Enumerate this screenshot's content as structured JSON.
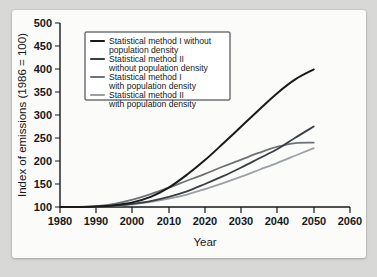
{
  "chart_data": {
    "type": "line",
    "title": "",
    "xlabel": "Year",
    "ylabel": "Index of emissions (1986 = 100)",
    "xlim": [
      1980,
      2060
    ],
    "ylim": [
      100,
      500
    ],
    "xticks": [
      1980,
      1990,
      2000,
      2010,
      2020,
      2030,
      2040,
      2050,
      2060
    ],
    "yticks": [
      100,
      150,
      200,
      250,
      300,
      350,
      400,
      450,
      500
    ],
    "grid": false,
    "legend_position": "upper-left",
    "x": [
      1980,
      1985,
      1990,
      1995,
      2000,
      2005,
      2010,
      2015,
      2020,
      2025,
      2030,
      2035,
      2040,
      2045,
      2050
    ],
    "series": [
      {
        "name": "Statistical method I without population density",
        "color": "#1a1a1a",
        "width": 2.0,
        "values": [
          100,
          100,
          101,
          104,
          110,
          122,
          142,
          170,
          202,
          238,
          275,
          312,
          348,
          378,
          399
        ]
      },
      {
        "name": "Statistical method II without population density",
        "color": "#3b3f44",
        "width": 1.8,
        "values": [
          100,
          100,
          101,
          103,
          107,
          113,
          122,
          134,
          150,
          167,
          186,
          206,
          226,
          251,
          275
        ]
      },
      {
        "name": "Statistical method I with population density",
        "color": "#6e7378",
        "width": 1.8,
        "values": [
          100,
          100,
          102,
          107,
          116,
          128,
          142,
          157,
          172,
          188,
          203,
          218,
          231,
          239,
          240
        ]
      },
      {
        "name": "Statistical method II with population density",
        "color": "#9aa0a5",
        "width": 1.8,
        "values": [
          100,
          100,
          101,
          103,
          106,
          111,
          118,
          127,
          139,
          152,
          166,
          181,
          196,
          212,
          228
        ]
      }
    ]
  },
  "legend": {
    "entries": [
      {
        "line1": "Statistical method I without",
        "line2": "population density"
      },
      {
        "line1": "Statistical method II",
        "line2": "without population density"
      },
      {
        "line1": "Statistical method I",
        "line2": "with population density"
      },
      {
        "line1": "Statistical method II",
        "line2": "with population density"
      }
    ]
  },
  "axis": {
    "y_tick_labels": [
      "500",
      "450",
      "400",
      "350",
      "300",
      "250",
      "200",
      "150",
      "100"
    ],
    "x_tick_labels": [
      "1980",
      "1990",
      "2000",
      "2010",
      "2020",
      "2030",
      "2040",
      "2050",
      "2060"
    ],
    "x_title": "Year",
    "y_title": "Index of emissions (1986 = 100)"
  }
}
